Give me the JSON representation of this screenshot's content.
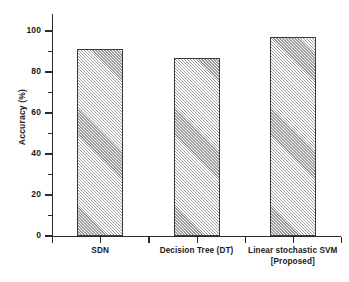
{
  "chart_data": {
    "type": "bar",
    "title": "",
    "xlabel": "",
    "ylabel": "Accuracy (%)",
    "categories": [
      "SDN",
      "Decision Tree (DT)",
      "Linear stochastic SVM [Proposed]"
    ],
    "category_lines": [
      [
        "SDN"
      ],
      [
        "Decision Tree (DT)"
      ],
      [
        "Linear stochastic SVM",
        "[Proposed]"
      ]
    ],
    "values": [
      91,
      87,
      97
    ],
    "ylim": [
      0,
      105
    ],
    "ytick_labels": [
      "0",
      "20",
      "40",
      "60",
      "80",
      "100"
    ],
    "ytick_values": [
      0,
      20,
      40,
      60,
      80,
      100
    ],
    "yminor_values": [
      10,
      30,
      50,
      70,
      90,
      100
    ],
    "grid": false,
    "legend": false,
    "bar_fill": "diagonal-hatch",
    "bar_fill_color": "#9d9d9d",
    "bar_edge_color": "#3a3a3a",
    "axis_color": "#2b2b2b",
    "background": "#ffffff"
  }
}
